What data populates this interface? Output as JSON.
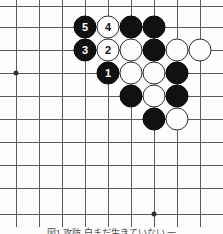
{
  "figure": {
    "kind": "go-board-diagram",
    "caption": "図1 攻防 白まだ生きていない 一",
    "board": {
      "columns": 9,
      "rows": 10,
      "grid_color": "#5a5a5a",
      "background_color": "#fefefe",
      "black_color": "#111111",
      "white_color": "#fdfdfd",
      "col_x": [
        16,
        39,
        62,
        85,
        108,
        131,
        154,
        177,
        200
      ],
      "row_y": [
        6,
        27,
        50,
        73,
        96,
        119,
        142,
        165,
        188,
        214
      ],
      "star_points": [
        {
          "name": "star-point-left",
          "col": 0,
          "row": 3
        },
        {
          "name": "star-point-bottom",
          "col": 6,
          "row": 9
        }
      ],
      "stones": [
        {
          "id": "b5",
          "color": "black",
          "col": 3,
          "row": 1,
          "label": "5"
        },
        {
          "id": "w4",
          "color": "white",
          "col": 4,
          "row": 1,
          "label": "4"
        },
        {
          "id": "b-c5r1",
          "color": "black",
          "col": 5,
          "row": 1,
          "label": ""
        },
        {
          "id": "b-c6r1",
          "color": "black",
          "col": 6,
          "row": 1,
          "label": ""
        },
        {
          "id": "b3",
          "color": "black",
          "col": 3,
          "row": 2,
          "label": "3"
        },
        {
          "id": "w2",
          "color": "white",
          "col": 4,
          "row": 2,
          "label": "2"
        },
        {
          "id": "w-c5r2",
          "color": "white",
          "col": 5,
          "row": 2,
          "label": ""
        },
        {
          "id": "b-c6r2",
          "color": "black",
          "col": 6,
          "row": 2,
          "label": ""
        },
        {
          "id": "w-c7r2",
          "color": "white",
          "col": 7,
          "row": 2,
          "label": ""
        },
        {
          "id": "w-c8r2",
          "color": "white",
          "col": 8,
          "row": 2,
          "label": ""
        },
        {
          "id": "b1",
          "color": "black",
          "col": 4,
          "row": 3,
          "label": "1"
        },
        {
          "id": "w-c5r3",
          "color": "white",
          "col": 5,
          "row": 3,
          "label": ""
        },
        {
          "id": "w-c6r3",
          "color": "white",
          "col": 6,
          "row": 3,
          "label": ""
        },
        {
          "id": "b-c7r3",
          "color": "black",
          "col": 7,
          "row": 3,
          "label": ""
        },
        {
          "id": "b-c5r4",
          "color": "black",
          "col": 5,
          "row": 4,
          "label": ""
        },
        {
          "id": "w-c6r4",
          "color": "white",
          "col": 6,
          "row": 4,
          "label": ""
        },
        {
          "id": "b-c7r4",
          "color": "black",
          "col": 7,
          "row": 4,
          "label": ""
        },
        {
          "id": "b-c6r5",
          "color": "black",
          "col": 6,
          "row": 5,
          "label": ""
        },
        {
          "id": "w-c7r5",
          "color": "white",
          "col": 7,
          "row": 5,
          "label": ""
        }
      ],
      "move_labels": [
        "1",
        "2",
        "3",
        "4",
        "5"
      ]
    }
  }
}
